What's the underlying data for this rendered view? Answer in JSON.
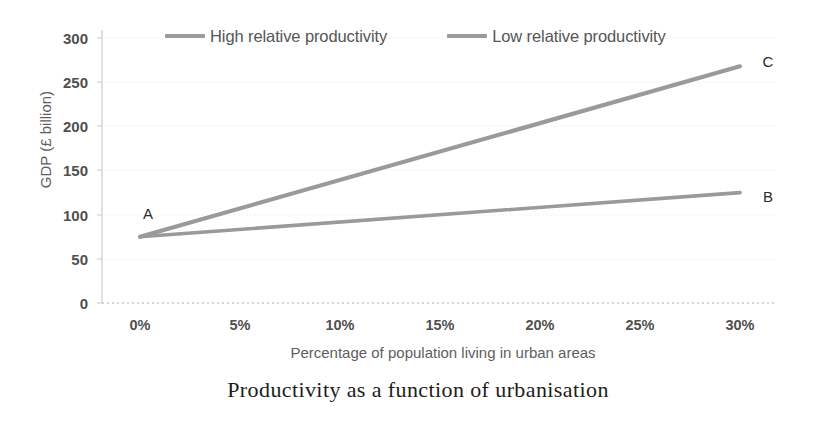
{
  "chart_data": {
    "type": "line",
    "title": "Productivity as a function of urbanisation",
    "xlabel": "Percentage of population living in urban areas",
    "ylabel": "GDP (£ billion)",
    "x": [
      0,
      5,
      10,
      15,
      20,
      25,
      30
    ],
    "xtick_labels": [
      "0%",
      "5%",
      "10%",
      "15%",
      "20%",
      "25%",
      "30%"
    ],
    "ytick_labels": [
      "0",
      "50",
      "100",
      "150",
      "200",
      "250",
      "300"
    ],
    "yticks": [
      0,
      50,
      100,
      150,
      200,
      250,
      300
    ],
    "xlim": [
      0,
      30
    ],
    "ylim": [
      0,
      300
    ],
    "grid": "horizontal-dotted",
    "legend_position": "top",
    "series": [
      {
        "name": "High relative productivity",
        "color": "#9a9a9a",
        "values": [
          75,
          107,
          139,
          171,
          203,
          236,
          268
        ],
        "end_label": "C"
      },
      {
        "name": "Low relative productivity",
        "color": "#9a9a9a",
        "values": [
          75,
          83,
          91,
          99,
          108,
          116,
          125
        ],
        "end_label": "B"
      }
    ],
    "annotations": [
      {
        "label": "A",
        "x": 0,
        "y": 75,
        "note": "common origin point"
      },
      {
        "label": "B",
        "x": 30,
        "y": 125,
        "note": "low productivity endpoint"
      },
      {
        "label": "C",
        "x": 30,
        "y": 268,
        "note": "high productivity endpoint"
      }
    ]
  },
  "legend": {
    "entries": [
      {
        "label": "High relative productivity"
      },
      {
        "label": "Low relative productivity"
      }
    ]
  },
  "caption": {
    "text": "Productivity as a function of urbanisation"
  }
}
